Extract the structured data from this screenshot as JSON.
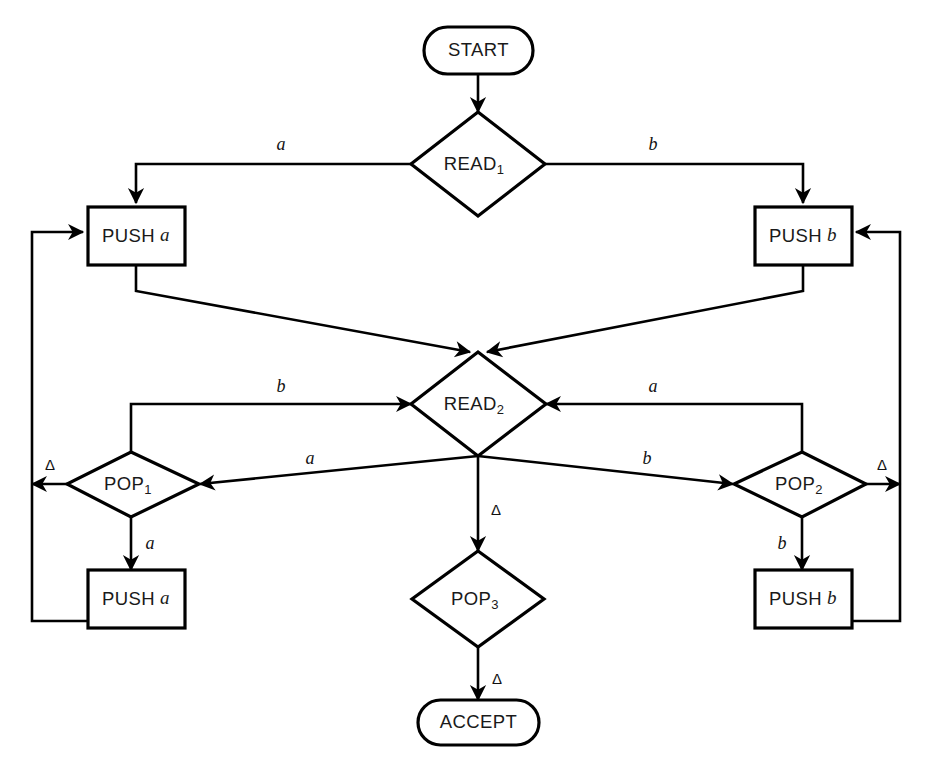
{
  "diagram": {
    "type": "flowchart",
    "background_color": "#ffffff",
    "line_color": "#000000",
    "text_color": "#1a1a1a"
  },
  "nodes": {
    "start": {
      "label": "START",
      "shape": "stadium"
    },
    "read1": {
      "label": "READ",
      "subscript": "1",
      "shape": "diamond"
    },
    "push_a_top": {
      "label": "PUSH",
      "operand": "a",
      "shape": "rectangle"
    },
    "push_b_top": {
      "label": "PUSH",
      "operand": "b",
      "shape": "rectangle"
    },
    "read2": {
      "label": "READ",
      "subscript": "2",
      "shape": "diamond"
    },
    "pop1": {
      "label": "POP",
      "subscript": "1",
      "shape": "diamond"
    },
    "pop2": {
      "label": "POP",
      "subscript": "2",
      "shape": "diamond"
    },
    "pop3": {
      "label": "POP",
      "subscript": "3",
      "shape": "diamond"
    },
    "push_a_bottom": {
      "label": "PUSH",
      "operand": "a",
      "shape": "rectangle"
    },
    "push_b_bottom": {
      "label": "PUSH",
      "operand": "b",
      "shape": "rectangle"
    },
    "accept": {
      "label": "ACCEPT",
      "shape": "stadium"
    }
  },
  "edge_labels": {
    "read1_to_push_a": "a",
    "read1_to_push_b": "b",
    "pop1_to_read2": "b",
    "read2_to_pop1": "a",
    "pop2_to_read2": "a",
    "read2_to_pop2": "b",
    "pop1_delta_out": "Δ",
    "pop2_delta_out": "Δ",
    "read2_to_pop3": "Δ",
    "pop1_to_push_a": "a",
    "pop2_to_push_b": "b",
    "pop3_to_accept": "Δ"
  }
}
